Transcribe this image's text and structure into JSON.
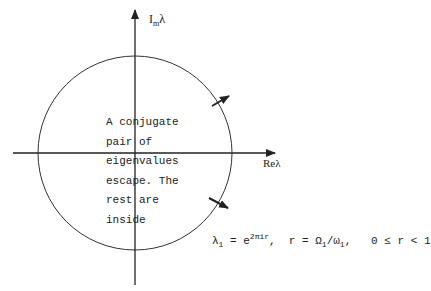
{
  "axes": {
    "imag_label": {
      "main": "I",
      "sub": "m",
      "tail": "λ"
    },
    "real_label": "Reλ"
  },
  "annotation": {
    "lines": [
      "A conjugate",
      "pair of",
      "eigenvalues",
      "escape.  The",
      "rest are",
      "inside"
    ]
  },
  "formula": {
    "lhs": "λ",
    "lhs_sub": "1",
    "eq": " = e",
    "exp": "2πir",
    "rest1": ",  r = Ω",
    "omega_sub": "1",
    "slash": "/ω",
    "omega2_sub": "1",
    "rest2": ",   0 ",
    "le": "≤",
    "rest3": " r < 1"
  },
  "colors": {
    "ink": "#222222",
    "background": "#ffffff"
  }
}
